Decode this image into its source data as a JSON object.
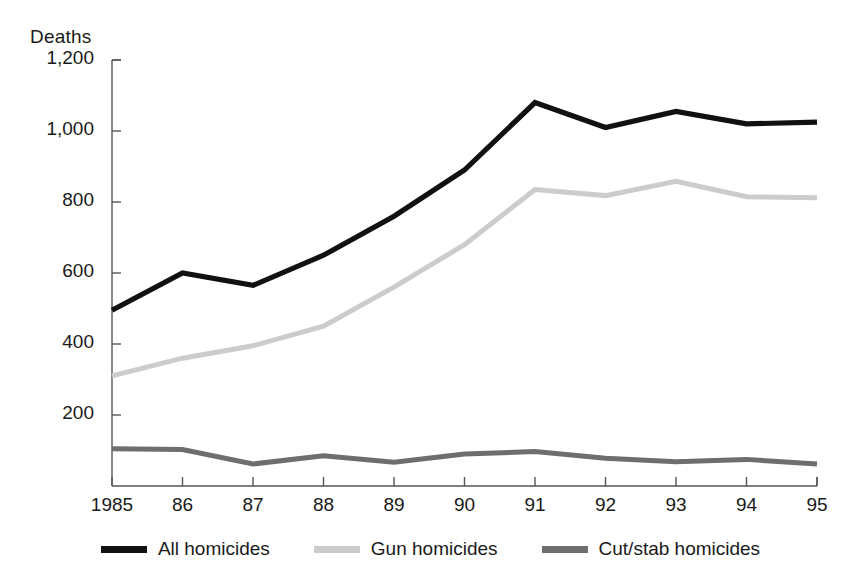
{
  "chart_data": {
    "type": "line",
    "title": "",
    "ylabel": "Deaths",
    "xlabel": "",
    "categories": [
      "1985",
      "86",
      "87",
      "88",
      "89",
      "90",
      "91",
      "92",
      "93",
      "94",
      "95"
    ],
    "x_tick_labels": [
      "1985",
      "86",
      "87",
      "88",
      "89",
      "90",
      "91",
      "92",
      "93",
      "94",
      "95"
    ],
    "y_tick_labels": [
      "200",
      "400",
      "600",
      "800",
      "1,000",
      "1,200"
    ],
    "y_tick_values": [
      200,
      400,
      600,
      800,
      1000,
      1200
    ],
    "ylim": [
      0,
      1200
    ],
    "grid": false,
    "legend_position": "bottom",
    "series": [
      {
        "name": "All homicides",
        "color": "#111111",
        "values": [
          495,
          600,
          565,
          650,
          760,
          890,
          1080,
          1010,
          1055,
          1020,
          1025
        ]
      },
      {
        "name": "Gun homicides",
        "color": "#cccccc",
        "values": [
          310,
          360,
          395,
          450,
          560,
          680,
          835,
          818,
          858,
          815,
          812
        ]
      },
      {
        "name": "Cut/stab homicides",
        "color": "#6e6e6e",
        "values": [
          105,
          103,
          62,
          85,
          67,
          90,
          97,
          78,
          68,
          75,
          62
        ]
      }
    ]
  },
  "axis": {
    "label_deaths": "Deaths"
  },
  "legend": {
    "items": [
      {
        "label": "All homicides",
        "color": "#111111"
      },
      {
        "label": "Gun homicides",
        "color": "#cccccc"
      },
      {
        "label": "Cut/stab homicides",
        "color": "#6e6e6e"
      }
    ]
  },
  "colors": {
    "axis": "#555555",
    "text": "#1a1a1a",
    "background": "#ffffff",
    "all_homicides": "#111111",
    "gun_homicides": "#cccccc",
    "cut_stab_homicides": "#6e6e6e"
  }
}
